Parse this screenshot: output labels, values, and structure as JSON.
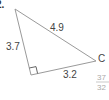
{
  "problem": {
    "number_fragment": "2."
  },
  "triangle": {
    "vertices": {
      "top": [
        15,
        9
      ],
      "right_angle": [
        31,
        75
      ],
      "C": [
        96,
        61
      ]
    },
    "labels": {
      "hypotenuse": "4.9",
      "left_leg": "3.7",
      "bottom_leg": "3.2",
      "vertex_C": "C"
    },
    "line_color": "#9a9a9a",
    "text_color": "#444444"
  },
  "answer_fragment": {
    "numerator": "37",
    "denominator": "32"
  }
}
